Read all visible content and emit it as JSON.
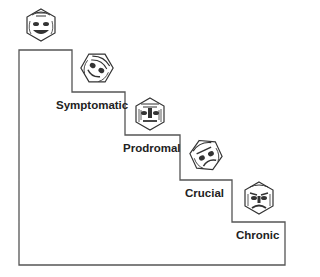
{
  "diagram": {
    "type": "staircase",
    "stages": [
      {
        "label": "Symptomatic",
        "face": "smiling-mask-icon"
      },
      {
        "label": "Prodromal",
        "face": "neutral-mask-icon"
      },
      {
        "label": "Crucial",
        "face": "distorted-mask-icon"
      },
      {
        "label": "Chronic",
        "face": "frowning-mask-icon"
      }
    ],
    "top_face": "happy-mask-icon",
    "line_color": "#444444"
  }
}
